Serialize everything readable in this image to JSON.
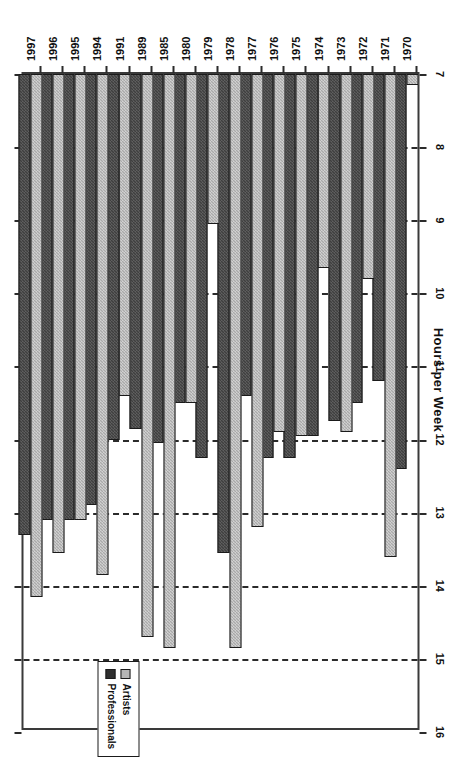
{
  "chart_data": {
    "type": "bar",
    "orientation": "horizontal",
    "title": "Hours per Week",
    "xlabel": "Hours per Week",
    "ylabel": "",
    "xlim": [
      7,
      16
    ],
    "xticks": [
      7,
      8,
      9,
      10,
      11,
      12,
      13,
      14,
      15,
      16
    ],
    "grid": true,
    "grid_axis": "x",
    "legend_position": "bottom-right",
    "categories": [
      "1970",
      "1971",
      "1972",
      "1973",
      "1974",
      "1975",
      "1976",
      "1977",
      "1978",
      "1979",
      "1980",
      "1985",
      "1989",
      "1991",
      "1994",
      "1995",
      "1996",
      "1997"
    ],
    "series": [
      {
        "name": "Artists",
        "color": "#a9a9a9",
        "values": [
          7.15,
          13.6,
          9.8,
          11.9,
          9.65,
          11.95,
          11.9,
          13.2,
          14.85,
          9.05,
          11.5,
          14.85,
          14.7,
          11.4,
          13.85,
          13.1,
          13.55,
          14.15
        ]
      },
      {
        "name": "Professionals",
        "color": "#3f3f3f",
        "values": [
          12.4,
          11.2,
          11.5,
          11.75,
          11.95,
          12.25,
          12.25,
          11.4,
          13.55,
          12.25,
          11.5,
          12.05,
          11.85,
          12.0,
          12.9,
          13.1,
          13.1,
          13.3
        ]
      }
    ]
  },
  "legend": {
    "entries": [
      {
        "label": "Artists",
        "swatch": "artists"
      },
      {
        "label": "Professionals",
        "swatch": "professionals"
      }
    ]
  }
}
